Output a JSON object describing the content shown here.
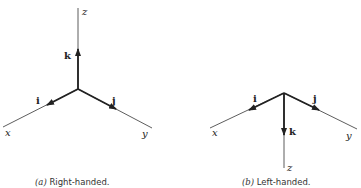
{
  "figure_a": {
    "caption_prefix": "(a)",
    "caption_text": " Right-handed.",
    "axes": {
      "x": "x",
      "y": "y",
      "z": "z"
    },
    "vectors": {
      "i": "i",
      "j": "j",
      "k": "k"
    }
  },
  "figure_b": {
    "caption_prefix": "(b)",
    "caption_text": " Left-handed.",
    "axes": {
      "x": "x",
      "y": "y",
      "z": "z"
    },
    "vectors": {
      "i": "i",
      "j": "j",
      "k": "k"
    }
  }
}
